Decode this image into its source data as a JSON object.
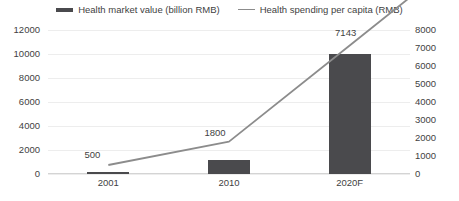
{
  "chart_data": {
    "type": "bar",
    "title": "",
    "categories": [
      "2001",
      "2010",
      "2020F"
    ],
    "series": [
      {
        "name": "Health market value (billion RMB)",
        "type": "bar",
        "axis": "left",
        "values": [
          60,
          1200,
          10000
        ],
        "color": "#4a4a4d"
      },
      {
        "name": "Health spending per capita (RMB)",
        "type": "line",
        "axis": "right",
        "values": [
          500,
          1800,
          7143
        ],
        "labels": [
          "500",
          "1800",
          "7143"
        ],
        "color": "#8c8c8c"
      }
    ],
    "left_axis": {
      "ticks": [
        "0",
        "2000",
        "4000",
        "6000",
        "8000",
        "10000",
        "12000"
      ],
      "min": 0,
      "max": 12000,
      "step": 2000
    },
    "right_axis": {
      "ticks": [
        "0",
        "1000",
        "2000",
        "3000",
        "4000",
        "5000",
        "6000",
        "7000",
        "8000"
      ],
      "min": 0,
      "max": 8000,
      "step": 1000
    },
    "xlabel": "",
    "ylabel": "",
    "grid": true,
    "legend_position": "top"
  },
  "legend": {
    "entries": [
      {
        "label": "Health market value (billion RMB)",
        "marker": "bar-swatch-icon"
      },
      {
        "label": "Health spending per capita (RMB)",
        "marker": "line-swatch-icon"
      }
    ]
  }
}
